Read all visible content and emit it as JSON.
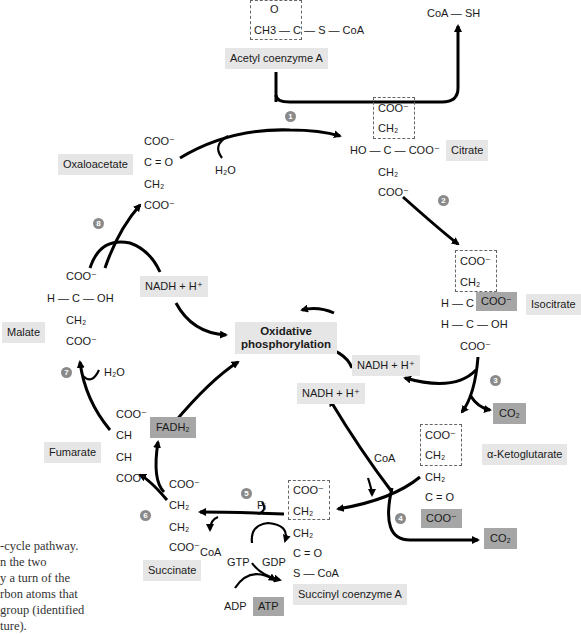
{
  "acetyl_coa": {
    "formula_top": "O",
    "formula_main": "CH3 — C — S — CoA",
    "label": "Acetyl coenzyme A"
  },
  "coash": "CoA — SH",
  "steps": [
    "1",
    "2",
    "3",
    "4",
    "5",
    "6",
    "7",
    "8"
  ],
  "citrate": {
    "label": "Citrate",
    "lines": [
      "COO⁻",
      "CH₂",
      "HO — C — COO⁻",
      "CH₂",
      "COO⁻"
    ]
  },
  "isocitrate": {
    "label": "Isocitrate",
    "lines": [
      "COO⁻",
      "CH₂",
      "H — C —",
      "COO⁻",
      "H — C — OH",
      "COO⁻"
    ]
  },
  "alpha_ketoglutarate": {
    "label": "α-Ketoglutarate",
    "lines": [
      "COO⁻",
      "CH₂",
      "CH₂",
      "C = O",
      "COO⁻"
    ]
  },
  "succinyl_coa": {
    "label": "Succinyl coenzyme A",
    "lines": [
      "COO⁻",
      "CH₂",
      "CH₂",
      "C = O",
      "S — CoA"
    ]
  },
  "succinate": {
    "label": "Succinate",
    "lines": [
      "COO⁻",
      "CH₂",
      "CH₂",
      "COO⁻"
    ]
  },
  "fumarate": {
    "label": "Fumarate",
    "lines": [
      "COO⁻",
      "CH",
      "CH",
      "COO⁻"
    ]
  },
  "malate": {
    "label": "Malate",
    "lines": [
      "COO⁻",
      "H — C — OH",
      "CH₂",
      "COO⁻"
    ]
  },
  "oxaloacetate": {
    "label": "Oxaloacetate",
    "lines": [
      "COO⁻",
      "C = O",
      "CH₂",
      "COO⁻"
    ]
  },
  "cofactors": {
    "h2o_top": "H₂O",
    "h2o_malate": "H₂O",
    "nadh_malate": "NADH + H⁺",
    "nadh_isocitrate": "NADH + H⁺",
    "nadh_akg": "NADH + H⁺",
    "co2_isocitrate": "CO₂",
    "co2_akg": "CO₂",
    "coa_akg": "CoA",
    "coa_succinyl": "CoA",
    "pi": "Pᵢ",
    "gtp": "GTP",
    "gdp": "GDP",
    "adp": "ADP",
    "atp": "ATP",
    "fadh2": "FADH₂"
  },
  "oxphos": {
    "line1": "Oxidative",
    "line2": "phosphorylation"
  },
  "caption_lines": [
    "-cycle pathway.",
    "n the two",
    "y a turn of the",
    "rbon atoms that",
    "group (identified",
    "ture)."
  ],
  "colors": {
    "label_bg": "#e6e6e6",
    "highlight_bg": "#a6a6a6",
    "step_circle": "#8a8a8a",
    "arrow": "#000000"
  }
}
